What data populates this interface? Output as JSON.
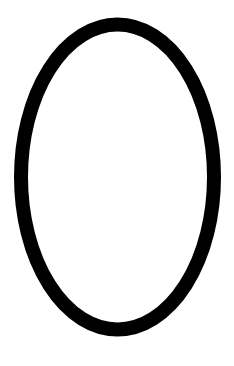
{
  "canvas": {
    "width": 234,
    "height": 366,
    "background": "#ffffff"
  },
  "shape": {
    "type": "ellipse",
    "cx": 117.5,
    "cy": 177,
    "rx": 96.5,
    "ry": 152.5,
    "stroke": "#000000",
    "stroke_width": 14,
    "fill": "#ffffff"
  }
}
